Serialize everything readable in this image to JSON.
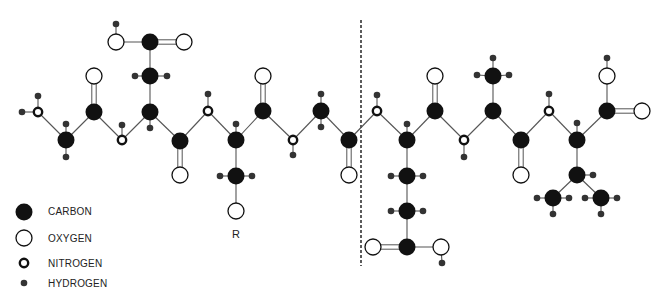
{
  "legend": {
    "items": [
      {
        "label": "CARBON",
        "symbol": "carbon-icon"
      },
      {
        "label": "OXYGEN",
        "symbol": "oxygen-icon"
      },
      {
        "label": "NITROGEN",
        "symbol": "nitrogen-icon"
      },
      {
        "label": "HYDROGEN",
        "symbol": "hydrogen-icon"
      }
    ]
  },
  "labels": {
    "r_group": "R"
  },
  "colors": {
    "carbon": "#111111",
    "oxygen_fill": "#ffffff",
    "outline": "#111111",
    "bond": "#555555",
    "hydrogen": "#333333",
    "divider": "#333333"
  },
  "atoms": [
    {
      "id": "n1",
      "type": "N",
      "x": 38,
      "y": 112
    },
    {
      "id": "h1",
      "type": "H",
      "x": 22,
      "y": 112
    },
    {
      "id": "h2",
      "type": "H",
      "x": 38,
      "y": 96
    },
    {
      "id": "c1",
      "type": "C",
      "x": 66,
      "y": 140
    },
    {
      "id": "h3",
      "type": "H",
      "x": 66,
      "y": 124
    },
    {
      "id": "h4",
      "type": "H",
      "x": 66,
      "y": 157
    },
    {
      "id": "c2",
      "type": "C",
      "x": 94,
      "y": 112
    },
    {
      "id": "o1",
      "type": "O",
      "x": 94,
      "y": 76
    },
    {
      "id": "n2",
      "type": "N",
      "x": 122,
      "y": 140
    },
    {
      "id": "h5",
      "type": "H",
      "x": 122,
      "y": 125
    },
    {
      "id": "c3",
      "type": "C",
      "x": 150,
      "y": 112
    },
    {
      "id": "h6",
      "type": "H",
      "x": 150,
      "y": 128
    },
    {
      "id": "c4",
      "type": "C",
      "x": 150,
      "y": 76
    },
    {
      "id": "h7",
      "type": "H",
      "x": 135,
      "y": 76
    },
    {
      "id": "h8",
      "type": "H",
      "x": 167,
      "y": 76
    },
    {
      "id": "c5",
      "type": "C",
      "x": 150,
      "y": 42
    },
    {
      "id": "o2",
      "type": "O",
      "x": 116,
      "y": 42
    },
    {
      "id": "h9",
      "type": "H",
      "x": 116,
      "y": 24
    },
    {
      "id": "o3",
      "type": "O",
      "x": 184,
      "y": 42
    },
    {
      "id": "c6",
      "type": "C",
      "x": 180,
      "y": 141
    },
    {
      "id": "o4",
      "type": "O",
      "x": 180,
      "y": 175
    },
    {
      "id": "n3",
      "type": "N",
      "x": 208,
      "y": 111
    },
    {
      "id": "h10",
      "type": "H",
      "x": 208,
      "y": 94
    },
    {
      "id": "c7",
      "type": "C",
      "x": 236,
      "y": 140
    },
    {
      "id": "h11",
      "type": "H",
      "x": 236,
      "y": 124
    },
    {
      "id": "c8",
      "type": "C",
      "x": 236,
      "y": 176
    },
    {
      "id": "h12",
      "type": "H",
      "x": 220,
      "y": 176
    },
    {
      "id": "h13",
      "type": "H",
      "x": 252,
      "y": 176
    },
    {
      "id": "o5",
      "type": "O",
      "x": 236,
      "y": 211
    },
    {
      "id": "c9",
      "type": "C",
      "x": 263,
      "y": 111
    },
    {
      "id": "o6",
      "type": "O",
      "x": 263,
      "y": 76
    },
    {
      "id": "n4",
      "type": "N",
      "x": 293,
      "y": 140
    },
    {
      "id": "h14",
      "type": "H",
      "x": 293,
      "y": 155
    },
    {
      "id": "c10",
      "type": "C",
      "x": 321,
      "y": 111
    },
    {
      "id": "h15",
      "type": "H",
      "x": 321,
      "y": 94
    },
    {
      "id": "h16",
      "type": "H",
      "x": 321,
      "y": 127
    },
    {
      "id": "c11",
      "type": "C",
      "x": 349,
      "y": 140
    },
    {
      "id": "o7",
      "type": "O",
      "x": 349,
      "y": 175
    },
    {
      "id": "n5",
      "type": "N",
      "x": 377,
      "y": 111
    },
    {
      "id": "h17",
      "type": "H",
      "x": 377,
      "y": 95
    },
    {
      "id": "c12",
      "type": "C",
      "x": 407,
      "y": 140
    },
    {
      "id": "h18",
      "type": "H",
      "x": 407,
      "y": 124
    },
    {
      "id": "c13",
      "type": "C",
      "x": 407,
      "y": 176
    },
    {
      "id": "h19",
      "type": "H",
      "x": 391,
      "y": 176
    },
    {
      "id": "h20",
      "type": "H",
      "x": 423,
      "y": 176
    },
    {
      "id": "c14",
      "type": "C",
      "x": 407,
      "y": 211
    },
    {
      "id": "h21",
      "type": "H",
      "x": 391,
      "y": 211
    },
    {
      "id": "h22",
      "type": "H",
      "x": 423,
      "y": 211
    },
    {
      "id": "c15",
      "type": "C",
      "x": 407,
      "y": 247
    },
    {
      "id": "o8",
      "type": "O",
      "x": 373,
      "y": 247
    },
    {
      "id": "o9",
      "type": "O",
      "x": 441,
      "y": 247
    },
    {
      "id": "h23",
      "type": "H",
      "x": 442,
      "y": 263
    },
    {
      "id": "c16",
      "type": "C",
      "x": 435,
      "y": 111
    },
    {
      "id": "o10",
      "type": "O",
      "x": 435,
      "y": 76
    },
    {
      "id": "n6",
      "type": "N",
      "x": 464,
      "y": 140
    },
    {
      "id": "h24",
      "type": "H",
      "x": 464,
      "y": 157
    },
    {
      "id": "c17",
      "type": "C",
      "x": 493,
      "y": 111
    },
    {
      "id": "c18",
      "type": "C",
      "x": 493,
      "y": 76
    },
    {
      "id": "h25",
      "type": "H",
      "x": 477,
      "y": 75
    },
    {
      "id": "h26",
      "type": "H",
      "x": 509,
      "y": 75
    },
    {
      "id": "h27",
      "type": "H",
      "x": 493,
      "y": 58
    },
    {
      "id": "c19",
      "type": "C",
      "x": 521,
      "y": 140
    },
    {
      "id": "o11",
      "type": "O",
      "x": 521,
      "y": 175
    },
    {
      "id": "n7",
      "type": "N",
      "x": 549,
      "y": 111
    },
    {
      "id": "h28",
      "type": "H",
      "x": 549,
      "y": 94
    },
    {
      "id": "c20",
      "type": "C",
      "x": 577,
      "y": 140
    },
    {
      "id": "h29",
      "type": "H",
      "x": 577,
      "y": 123
    },
    {
      "id": "c21",
      "type": "C",
      "x": 607,
      "y": 111
    },
    {
      "id": "o12",
      "type": "O",
      "x": 607,
      "y": 76
    },
    {
      "id": "h30",
      "type": "H",
      "x": 607,
      "y": 58
    },
    {
      "id": "o13",
      "type": "O",
      "x": 642,
      "y": 111
    },
    {
      "id": "c22",
      "type": "C",
      "x": 577,
      "y": 175
    },
    {
      "id": "h31",
      "type": "H",
      "x": 593,
      "y": 175
    },
    {
      "id": "c23",
      "type": "C",
      "x": 553,
      "y": 198
    },
    {
      "id": "h32",
      "type": "H",
      "x": 537,
      "y": 198
    },
    {
      "id": "h33",
      "type": "H",
      "x": 569,
      "y": 198
    },
    {
      "id": "h34",
      "type": "H",
      "x": 553,
      "y": 214
    },
    {
      "id": "c24",
      "type": "C",
      "x": 601,
      "y": 198
    },
    {
      "id": "h35",
      "type": "H",
      "x": 585,
      "y": 198
    },
    {
      "id": "h36",
      "type": "H",
      "x": 617,
      "y": 198
    },
    {
      "id": "h37",
      "type": "H",
      "x": 601,
      "y": 214
    }
  ],
  "bonds": [
    [
      "n1",
      "h1",
      1
    ],
    [
      "n1",
      "h2",
      1
    ],
    [
      "n1",
      "c1",
      1
    ],
    [
      "c1",
      "h3",
      1
    ],
    [
      "c1",
      "h4",
      1
    ],
    [
      "c1",
      "c2",
      1
    ],
    [
      "c2",
      "o1",
      2
    ],
    [
      "c2",
      "n2",
      1
    ],
    [
      "n2",
      "h5",
      1
    ],
    [
      "n2",
      "c3",
      1
    ],
    [
      "c3",
      "h6",
      1
    ],
    [
      "c3",
      "c4",
      1
    ],
    [
      "c4",
      "h7",
      1
    ],
    [
      "c4",
      "h8",
      1
    ],
    [
      "c4",
      "c5",
      1
    ],
    [
      "c5",
      "o2",
      1
    ],
    [
      "o2",
      "h9",
      1
    ],
    [
      "c5",
      "o3",
      2
    ],
    [
      "c3",
      "c6",
      1
    ],
    [
      "c6",
      "o4",
      2
    ],
    [
      "c6",
      "n3",
      1
    ],
    [
      "n3",
      "h10",
      1
    ],
    [
      "n3",
      "c7",
      1
    ],
    [
      "c7",
      "h11",
      1
    ],
    [
      "c7",
      "c8",
      1
    ],
    [
      "c8",
      "h12",
      1
    ],
    [
      "c8",
      "h13",
      1
    ],
    [
      "c8",
      "o5",
      1
    ],
    [
      "c7",
      "c9",
      1
    ],
    [
      "c9",
      "o6",
      2
    ],
    [
      "c9",
      "n4",
      1
    ],
    [
      "n4",
      "h14",
      1
    ],
    [
      "n4",
      "c10",
      1
    ],
    [
      "c10",
      "h15",
      1
    ],
    [
      "c10",
      "h16",
      1
    ],
    [
      "c10",
      "c11",
      1
    ],
    [
      "c11",
      "o7",
      2
    ],
    [
      "c11",
      "n5",
      1
    ],
    [
      "n5",
      "h17",
      1
    ],
    [
      "n5",
      "c12",
      1
    ],
    [
      "c12",
      "h18",
      1
    ],
    [
      "c12",
      "c13",
      1
    ],
    [
      "c13",
      "h19",
      1
    ],
    [
      "c13",
      "h20",
      1
    ],
    [
      "c13",
      "c14",
      1
    ],
    [
      "c14",
      "h21",
      1
    ],
    [
      "c14",
      "h22",
      1
    ],
    [
      "c14",
      "c15",
      1
    ],
    [
      "c15",
      "o8",
      2
    ],
    [
      "c15",
      "o9",
      1
    ],
    [
      "o9",
      "h23",
      1
    ],
    [
      "c12",
      "c16",
      1
    ],
    [
      "c16",
      "o10",
      2
    ],
    [
      "c16",
      "n6",
      1
    ],
    [
      "n6",
      "h24",
      1
    ],
    [
      "n6",
      "c17",
      1
    ],
    [
      "c17",
      "c18",
      1
    ],
    [
      "c18",
      "h25",
      1
    ],
    [
      "c18",
      "h26",
      1
    ],
    [
      "c18",
      "h27",
      1
    ],
    [
      "c17",
      "c19",
      1
    ],
    [
      "c19",
      "o11",
      2
    ],
    [
      "c19",
      "n7",
      1
    ],
    [
      "n7",
      "h28",
      1
    ],
    [
      "n7",
      "c20",
      1
    ],
    [
      "c20",
      "h29",
      1
    ],
    [
      "c20",
      "c21",
      1
    ],
    [
      "c21",
      "o12",
      1
    ],
    [
      "o12",
      "h30",
      1
    ],
    [
      "c21",
      "o13",
      2
    ],
    [
      "c20",
      "c22",
      1
    ],
    [
      "c22",
      "h31",
      1
    ],
    [
      "c22",
      "c23",
      1
    ],
    [
      "c22",
      "c24",
      1
    ],
    [
      "c23",
      "h32",
      1
    ],
    [
      "c23",
      "h33",
      1
    ],
    [
      "c23",
      "h34",
      1
    ],
    [
      "c24",
      "h35",
      1
    ],
    [
      "c24",
      "h36",
      1
    ],
    [
      "c24",
      "h37",
      1
    ]
  ],
  "divider": {
    "x": 361,
    "y1": 20,
    "y2": 266
  },
  "r_position": {
    "x": 236,
    "y": 235
  }
}
